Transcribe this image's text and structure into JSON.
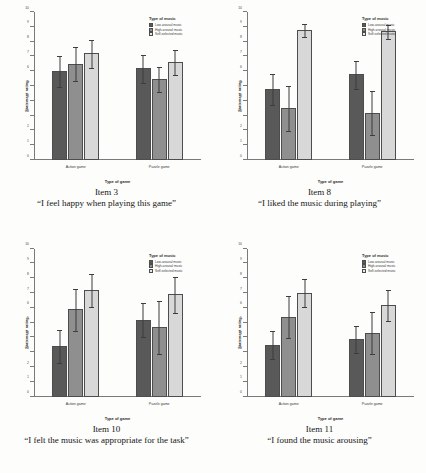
{
  "figure": {
    "common": {
      "legend_title": "Type of music",
      "ylabel": "Statement rating",
      "xlabel": "Type of game",
      "categories": [
        "Action game",
        "Puzzle game"
      ],
      "series_names": [
        "Low-arousal music",
        "High-arousal music",
        "Self-selected music"
      ],
      "series_colors": [
        "#595959",
        "#8f8f8f",
        "#d8d8d8"
      ],
      "yticks": [
        "0",
        "1",
        "2",
        "3",
        "4",
        "5",
        "6",
        "7",
        "8",
        "9",
        "10"
      ],
      "ylim": [
        0,
        10
      ]
    },
    "panels": [
      {
        "item_label": "Item 3",
        "caption": "“I feel happy when playing this game”",
        "chart_data": {
          "type": "bar",
          "title": "Item 3",
          "xlabel": "Type of game",
          "ylabel": "Statement rating",
          "ylim": [
            0,
            10
          ],
          "grid": false,
          "legend_position": "top-right",
          "categories": [
            "Action game",
            "Puzzle game"
          ],
          "series": [
            {
              "name": "Low-arousal music",
              "values": [
                6.0,
                6.2
              ],
              "errors": [
                1.1,
                1.0
              ]
            },
            {
              "name": "High-arousal music",
              "values": [
                6.5,
                5.5
              ],
              "errors": [
                1.2,
                0.9
              ]
            },
            {
              "name": "Self-selected music",
              "values": [
                7.2,
                6.6
              ],
              "errors": [
                1.0,
                0.9
              ]
            }
          ]
        }
      },
      {
        "item_label": "Item 8",
        "caption": "“I liked the music during playing”",
        "chart_data": {
          "type": "bar",
          "title": "Item 8",
          "xlabel": "Type of game",
          "ylabel": "Statement rating",
          "ylim": [
            0,
            10
          ],
          "grid": false,
          "legend_position": "top-right",
          "categories": [
            "Action game",
            "Puzzle game"
          ],
          "series": [
            {
              "name": "Low-arousal music",
              "values": [
                4.8,
                5.8
              ],
              "errors": [
                1.1,
                1.0
              ]
            },
            {
              "name": "High-arousal music",
              "values": [
                3.5,
                3.2
              ],
              "errors": [
                1.6,
                1.6
              ]
            },
            {
              "name": "Self-selected music",
              "values": [
                8.8,
                8.7
              ],
              "errors": [
                0.5,
                0.5
              ]
            }
          ]
        }
      },
      {
        "item_label": "Item 10",
        "caption": "“I felt the music was appropriate for the task”",
        "chart_data": {
          "type": "bar",
          "title": "Item 10",
          "xlabel": "Type of game",
          "ylabel": "Statement rating",
          "ylim": [
            0,
            10
          ],
          "grid": false,
          "legend_position": "top-right",
          "categories": [
            "Action game",
            "Puzzle game"
          ],
          "series": [
            {
              "name": "Low-arousal music",
              "values": [
                3.4,
                5.2
              ],
              "errors": [
                1.2,
                1.2
              ]
            },
            {
              "name": "High-arousal music",
              "values": [
                5.9,
                4.7
              ],
              "errors": [
                1.5,
                1.9
              ]
            },
            {
              "name": "Self-selected music",
              "values": [
                7.2,
                6.9
              ],
              "errors": [
                1.2,
                1.3
              ]
            }
          ]
        }
      },
      {
        "item_label": "Item 11",
        "caption": "“I found the music arousing”",
        "chart_data": {
          "type": "bar",
          "title": "Item 11",
          "xlabel": "Type of game",
          "ylabel": "Statement rating",
          "ylim": [
            0,
            10
          ],
          "grid": false,
          "legend_position": "top-right",
          "categories": [
            "Action game",
            "Puzzle game"
          ],
          "series": [
            {
              "name": "Low-arousal music",
              "values": [
                3.5,
                3.9
              ],
              "errors": [
                1.0,
                1.0
              ]
            },
            {
              "name": "High-arousal music",
              "values": [
                5.4,
                4.3
              ],
              "errors": [
                1.5,
                1.5
              ]
            },
            {
              "name": "Self-selected music",
              "values": [
                7.0,
                6.2
              ],
              "errors": [
                1.0,
                1.1
              ]
            }
          ]
        }
      }
    ]
  }
}
